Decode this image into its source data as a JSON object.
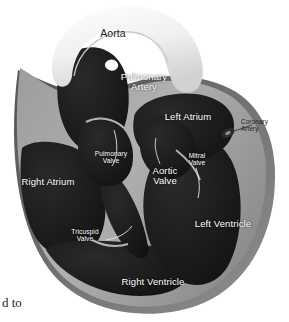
{
  "figure": {
    "style": "grayscale medical illustration",
    "background_color": "#ffffff",
    "chamber_fill": "#1c1c1c",
    "wall_fill": "#a9a9a9",
    "wall_shadow": "#6e6e6e",
    "aorta_fill": "#f2f2f2",
    "label_color_light": "#ffffff",
    "label_color_dark": "#1d1d1d"
  },
  "labels": {
    "aorta": "Aorta",
    "pulmonary_artery": "Pulmonary\nArtery",
    "left_atrium": "Left Atrium",
    "right_atrium": "Right Atrium",
    "left_ventricle": "Left Ventricle",
    "right_ventricle": "Right Ventricle",
    "aortic_valve": "Aortic\nValve",
    "pulmonary_valve": "Pulmonary\nValve",
    "mitral_valve": "Mitral\nValve",
    "tricuspid_valve": "Tricuspid\nValve",
    "coronary_artery": "Coronary\nArtery"
  },
  "page_text": {
    "fragment": "d to"
  }
}
